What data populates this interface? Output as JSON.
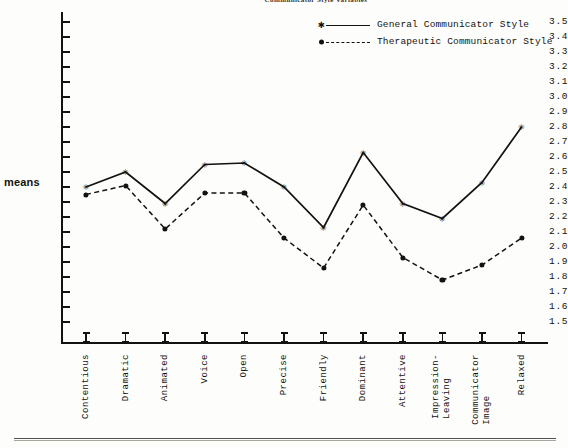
{
  "chart_data": {
    "type": "line",
    "title": "Communicator Style Variables",
    "xlabel": "",
    "ylabel": "means",
    "ylim": [
      1.5,
      3.5
    ],
    "ytick_step": 0.1,
    "ytick_labels": [
      "3.5",
      "3.4",
      "3.3",
      "3.2",
      "3.1",
      "3.0",
      "2.9",
      "2.8",
      "2.7",
      "2.6",
      "2.5",
      "2.4",
      "2.3",
      "2.2",
      "2.1",
      "2.0",
      "1.9",
      "1.8",
      "1.7",
      "1.6",
      "1.5"
    ],
    "grid": false,
    "legend_position": "top-right",
    "categories": [
      "Contentious",
      "Dramatic",
      "Animated",
      "Voice",
      "Open",
      "Precise",
      "Friendly",
      "Dominant",
      "Attentive",
      "Impression-\nLeaving",
      "Communicator\nImage",
      "Relaxed"
    ],
    "series": [
      {
        "name": "General Communicator Style",
        "marker": "star",
        "line": "solid",
        "values": [
          2.4,
          2.5,
          2.29,
          2.55,
          2.56,
          2.4,
          2.13,
          2.63,
          2.29,
          2.19,
          2.43,
          2.8
        ]
      },
      {
        "name": "Therapeutic Communicator Style",
        "marker": "dot",
        "line": "dashed",
        "values": [
          2.35,
          2.41,
          2.12,
          2.36,
          2.36,
          2.06,
          1.86,
          2.28,
          1.93,
          1.78,
          1.88,
          2.06
        ]
      }
    ],
    "colors": {
      "line": "#14120f",
      "background": "#fdfdfb"
    }
  }
}
